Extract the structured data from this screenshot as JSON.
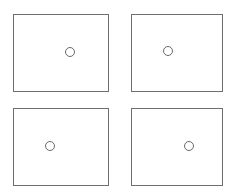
{
  "diagram": {
    "colors": {
      "border": "#6e6e6e",
      "marker": "#6a6a6a",
      "background": "#ffffff"
    },
    "panels": [
      {
        "id": "top-left",
        "x": 13,
        "y": 14,
        "w": 96,
        "h": 78,
        "marker": {
          "cx": 70,
          "cy": 52
        }
      },
      {
        "id": "top-right",
        "x": 131,
        "y": 14,
        "w": 92,
        "h": 78,
        "marker": {
          "cx": 168,
          "cy": 51
        }
      },
      {
        "id": "bottom-left",
        "x": 13,
        "y": 108,
        "w": 96,
        "h": 78,
        "marker": {
          "cx": 50,
          "cy": 146
        }
      },
      {
        "id": "bottom-right",
        "x": 131,
        "y": 108,
        "w": 92,
        "h": 78,
        "marker": {
          "cx": 189,
          "cy": 146
        }
      }
    ]
  }
}
